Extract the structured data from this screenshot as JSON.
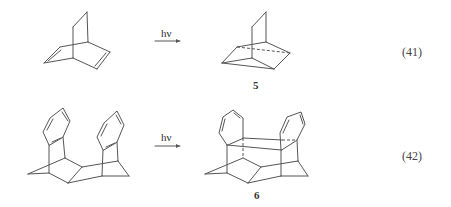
{
  "reactions": [
    {
      "equation_number": "(41)",
      "reactant": "bicyclo[2.2.2]octa-2,5-diene",
      "condition": "hν",
      "product_label": "5"
    },
    {
      "equation_number": "(42)",
      "reactant": "bis-benzo-fused bridged diene dimer",
      "condition": "hν",
      "product_label": "6"
    }
  ]
}
